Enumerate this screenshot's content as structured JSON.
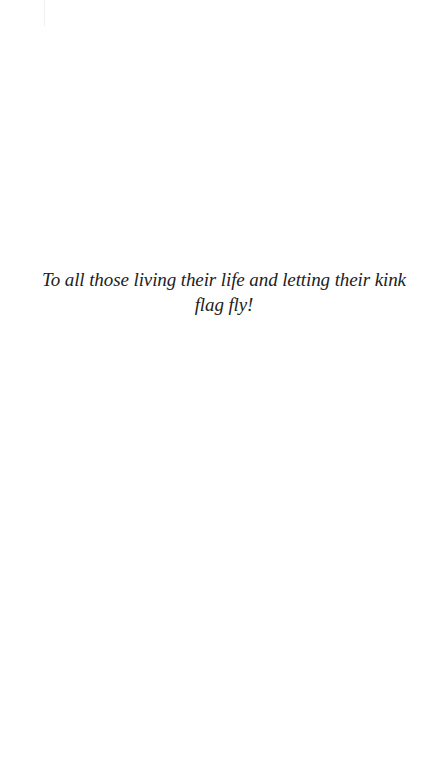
{
  "page": {
    "background": "#ffffff",
    "text_color": "#222222"
  },
  "dedication": {
    "text": "To all those living their life and letting their kink flag fly!"
  }
}
